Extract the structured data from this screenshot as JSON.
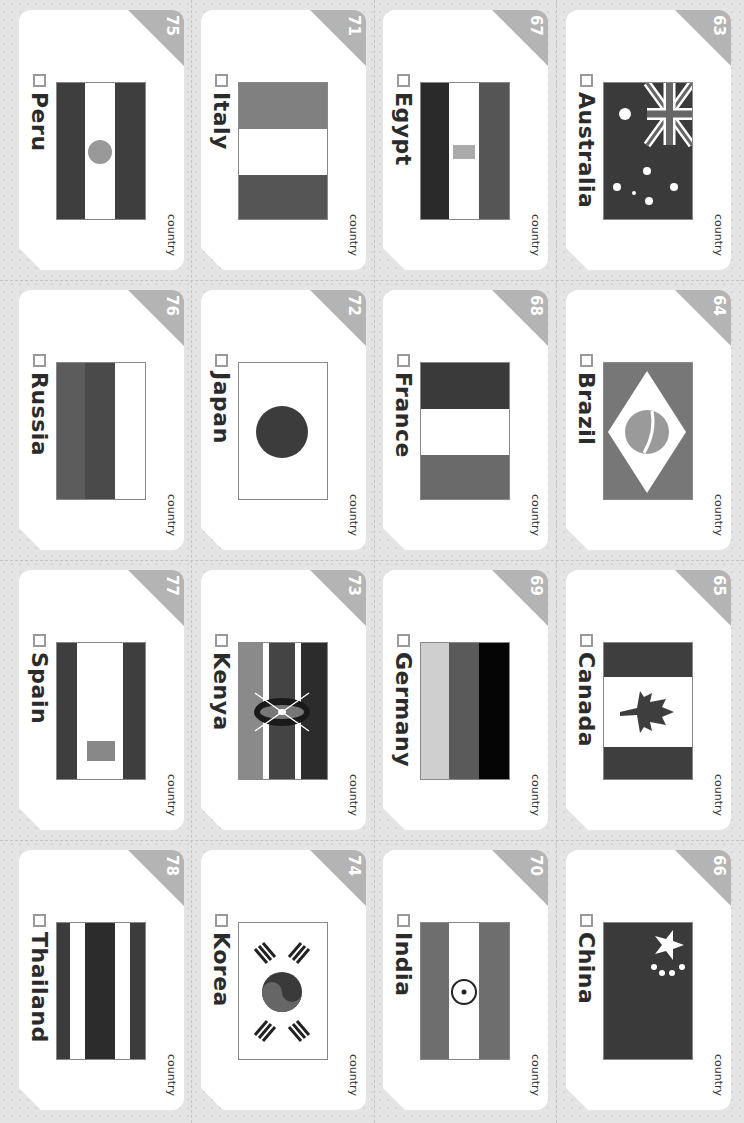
{
  "sheet": {
    "card_type_label": "country",
    "cards": [
      {
        "number": "63",
        "name": "Australia",
        "flag": "australia"
      },
      {
        "number": "64",
        "name": "Brazil",
        "flag": "brazil"
      },
      {
        "number": "65",
        "name": "Canada",
        "flag": "canada"
      },
      {
        "number": "66",
        "name": "China",
        "flag": "china"
      },
      {
        "number": "67",
        "name": "Egypt",
        "flag": "egypt"
      },
      {
        "number": "68",
        "name": "France",
        "flag": "france"
      },
      {
        "number": "69",
        "name": "Germany",
        "flag": "germany"
      },
      {
        "number": "70",
        "name": "India",
        "flag": "india"
      },
      {
        "number": "71",
        "name": "Italy",
        "flag": "italy"
      },
      {
        "number": "72",
        "name": "Japan",
        "flag": "japan"
      },
      {
        "number": "73",
        "name": "Kenya",
        "flag": "kenya"
      },
      {
        "number": "74",
        "name": "Korea",
        "flag": "korea"
      },
      {
        "number": "75",
        "name": "Peru",
        "flag": "peru"
      },
      {
        "number": "76",
        "name": "Russia",
        "flag": "russia"
      },
      {
        "number": "77",
        "name": "Spain",
        "flag": "spain"
      },
      {
        "number": "78",
        "name": "Thailand",
        "flag": "thailand"
      }
    ]
  },
  "colors": {
    "badge": "#b4b4b4",
    "card": "#ffffff",
    "background": "#e4e4e4"
  }
}
